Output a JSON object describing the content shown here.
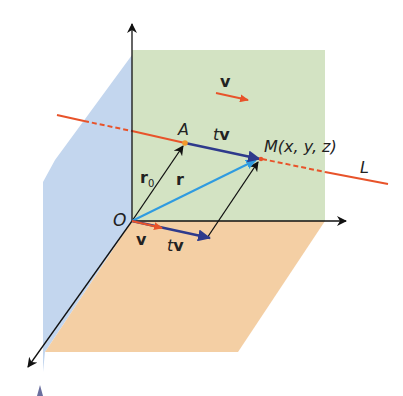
{
  "diagram": {
    "type": "vector-equation-of-line-3d",
    "colors": {
      "yz_plane": "#c3d6ee",
      "xz_plane": "#d3e3c3",
      "xy_plane": "#f4cfa4",
      "line_L": "#e8532a",
      "vector_v": "#e8532a",
      "vector_tv": "#2e3a8c",
      "vector_r": "#2f9be0",
      "vector_r0": "#111111",
      "point_A": "#f39a2b"
    },
    "labels": {
      "origin": "O",
      "point_A": "A",
      "point_M": "M(x, y, z)",
      "line": "L",
      "v_top": "v",
      "tv_top_t": "t",
      "tv_top_v": "v",
      "r0_r": "r",
      "r0_sub": "0",
      "r": "r",
      "v_bottom": "v",
      "tv_bottom_t": "t",
      "tv_bottom_v": "v"
    }
  }
}
